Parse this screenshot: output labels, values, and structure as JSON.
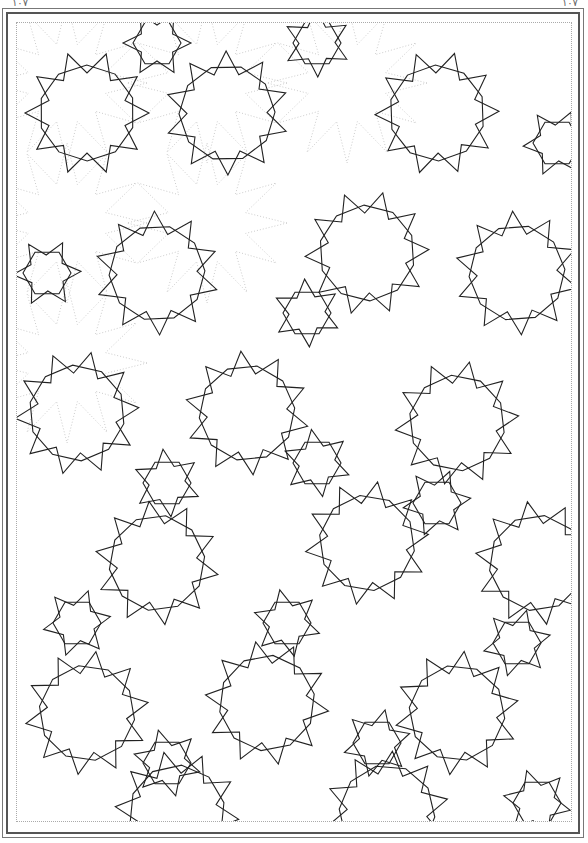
{
  "page": {
    "number_left": "۱۰۷",
    "number_right": "۱۰۷"
  },
  "plate": {
    "description": "Girih geometric star pattern",
    "line_color": "#222222",
    "guide_color": "#aaaaaa",
    "background": "#ffffff"
  }
}
